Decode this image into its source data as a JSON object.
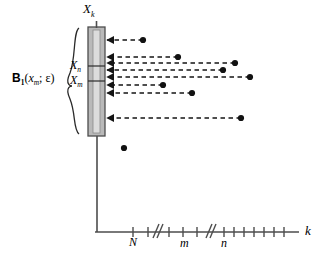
{
  "figure": {
    "type": "diagram",
    "axis": {
      "x_label": "k",
      "y_label": "",
      "tick_labels": [
        "N",
        "m",
        "n"
      ],
      "break_marks": 2
    },
    "bar": {
      "top_label": "X",
      "top_label_sub": "k",
      "inner_labels": [
        {
          "text": "X",
          "sub": "n"
        },
        {
          "text": "X",
          "sub": "m"
        }
      ]
    },
    "brace": {
      "label_main": "B",
      "label_main_sub": "1",
      "label_rest": "(x",
      "label_rest_sub": "m",
      "label_tail": "; ε)",
      "label_full": "B₁(xₘ; ε)"
    },
    "arrows": [
      {
        "y": 40,
        "x_dot": 143
      },
      {
        "y": 57,
        "x_dot": 178
      },
      {
        "y": 63,
        "x_dot": 235
      },
      {
        "y": 70,
        "x_dot": 223
      },
      {
        "y": 77,
        "x_dot": 250
      },
      {
        "y": 85,
        "x_dot": 163
      },
      {
        "y": 93,
        "x_dot": 192
      },
      {
        "y": 118,
        "x_dot": 241
      }
    ],
    "stray_dots": [
      {
        "x": 124,
        "y": 148
      }
    ],
    "colors": {
      "ink": "#1a1a1a",
      "bar_fill": "#b8b8b8",
      "bar_edge": "#4d4d4d",
      "bar_inner": "#d6d6d6"
    }
  }
}
